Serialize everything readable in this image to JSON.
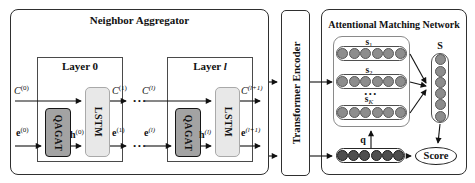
{
  "colors": {
    "qagat_fill": "#a3a3a3",
    "lstm_fill": "#e8e8e8",
    "support_node_fill": "#8d8d8d",
    "query_node_fill": "#4e4e4e",
    "arrow": "#111111"
  },
  "dots": "...",
  "neighbor_aggregator": {
    "title": "Neighbor Aggregator",
    "layer0": {
      "title_word": "Layer",
      "title_index": "0",
      "qagat": "QAGAT",
      "lstm": "LSTM",
      "c_in": {
        "base": "C",
        "sup": "(0)"
      },
      "e_in": {
        "base": "e",
        "sup": "(0)"
      },
      "h": {
        "base": "h",
        "sup": "(0)"
      },
      "c_out": {
        "base": "C",
        "sup": "(1)"
      },
      "e_out": {
        "base": "e",
        "sup": "(1)"
      }
    },
    "layer_l": {
      "title_word": "Layer",
      "title_index": "l",
      "qagat": "QAGAT",
      "lstm": "LSTM",
      "c_in": {
        "base": "C",
        "sup": "(l)"
      },
      "e_in": {
        "base": "e",
        "sup": "(l)"
      },
      "h": {
        "base": "h",
        "sup": "(l)"
      },
      "c_out": {
        "base": "C",
        "sup": "(l+1)"
      },
      "e_out": {
        "base": "e",
        "sup": "(l+1)"
      }
    }
  },
  "transformer_encoder": {
    "title": "Transformer Encoder"
  },
  "attentional_matching_network": {
    "title": "Attentional Matching Network",
    "support_rows": [
      {
        "label_base": "s",
        "label_sub": "1",
        "circles": 6
      },
      {
        "label_base": "s",
        "label_sub": "2",
        "circles": 6
      },
      {
        "label_base": "s",
        "label_sub": "K",
        "circles": 6
      }
    ],
    "ellipsis": "...",
    "s_vector": {
      "label": "S",
      "circles": 6
    },
    "query_vector": {
      "label": "q",
      "circles": 6
    },
    "score_label": "Score"
  }
}
